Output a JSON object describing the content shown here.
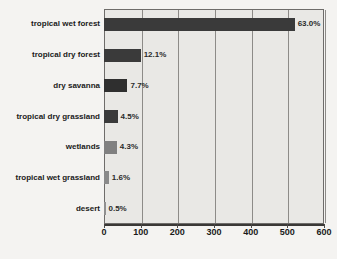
{
  "chart_data": {
    "type": "bar",
    "orientation": "horizontal",
    "title": "",
    "subtitle": "",
    "xlabel": "",
    "ylabel": "",
    "xlim": [
      0,
      600
    ],
    "xticks": [
      0,
      100,
      200,
      300,
      400,
      500,
      600
    ],
    "xtick_labels": [
      "0",
      "100",
      "200",
      "300",
      "400",
      "500",
      "600"
    ],
    "grid": true,
    "grid_axis": "x",
    "legend": false,
    "categories": [
      "tropical wet forest",
      "tropical dry forest",
      "dry savanna",
      "tropical dry grassland",
      "wetlands",
      "tropical wet grassland",
      "desert"
    ],
    "values": [
      520,
      100,
      64,
      37,
      35,
      13,
      4
    ],
    "data_labels": [
      "63.0%",
      "12.1%",
      "7.7%",
      "4.5%",
      "4.3%",
      "1.6%",
      "0.5%"
    ],
    "percentages": [
      63.0,
      12.1,
      7.7,
      4.5,
      4.3,
      1.6,
      0.5
    ],
    "bar_colors": [
      "#3a3a3a",
      "#3a3a3a",
      "#2f2f2f",
      "#3a3a3a",
      "#808080",
      "#8a8a8a",
      "#909090"
    ],
    "plot_background": "#e9e8e5",
    "page_background": "#f4f3f1",
    "gridline_color": "#8d8b88",
    "axis_color": "#3a3836"
  }
}
